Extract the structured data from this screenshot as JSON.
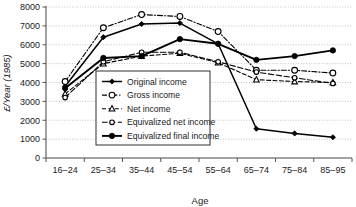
{
  "chart_data": {
    "type": "line",
    "title": "",
    "xlabel": "Age",
    "ylabel": "£/Year (1985)",
    "categories": [
      "16–24",
      "25–34",
      "35–44",
      "45–54",
      "55–64",
      "65–74",
      "75–84",
      "85–95"
    ],
    "ylim": [
      0,
      8000
    ],
    "yticks": [
      "0",
      "1000",
      "2000",
      "3000",
      "4000",
      "5000",
      "6000",
      "7000",
      "8000"
    ],
    "ytick_values": [
      0,
      1000,
      2000,
      3000,
      4000,
      5000,
      6000,
      7000,
      8000
    ],
    "grid": true,
    "grid_axis": "y",
    "legend_position": "center-left-inside",
    "series": [
      {
        "name": "Original income",
        "values": [
          3800,
          6400,
          7100,
          7150,
          6050,
          1550,
          1300,
          1100
        ],
        "marker": "filled-diamond",
        "linestyle": "solid",
        "color": "#000000"
      },
      {
        "name": "Gross income",
        "values": [
          4050,
          6900,
          7600,
          7500,
          6700,
          4650,
          4650,
          4500
        ],
        "marker": "open-circle",
        "linestyle": "dash-dot",
        "color": "#000000"
      },
      {
        "name": "Net income",
        "values": [
          3400,
          5000,
          5400,
          5550,
          5050,
          4150,
          4050,
          4000
        ],
        "marker": "open-triangle",
        "linestyle": "dashed",
        "color": "#000000"
      },
      {
        "name": "Equivalized net income",
        "values": [
          3200,
          5100,
          5600,
          5600,
          5100,
          4550,
          4250,
          3950
        ],
        "marker": "open-circle-small",
        "linestyle": "dashed-long",
        "color": "#000000"
      },
      {
        "name": "Equivalized final income",
        "values": [
          3700,
          5300,
          5400,
          6300,
          6050,
          5200,
          5400,
          5700
        ],
        "marker": "filled-circle",
        "linestyle": "solid-thick",
        "color": "#000000"
      }
    ]
  },
  "legend": {
    "items": [
      {
        "label": "Original income"
      },
      {
        "label": "Gross income"
      },
      {
        "label": "Net income"
      },
      {
        "label": "Equivalized net income"
      },
      {
        "label": "Equivalized final income"
      }
    ]
  }
}
